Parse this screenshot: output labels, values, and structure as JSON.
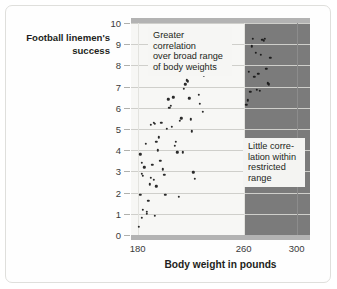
{
  "chart_data": {
    "type": "scatter",
    "title": "",
    "xlabel": "Body weight in pounds",
    "ylabel": "Football linemen's success",
    "xlim": [
      175,
      310
    ],
    "ylim": [
      0,
      10
    ],
    "xticks": [
      180,
      260,
      300
    ],
    "yticks": [
      0,
      1,
      2,
      3,
      4,
      5,
      6,
      7,
      8,
      9,
      10
    ],
    "grid": true,
    "legend": "none",
    "regions": [
      {
        "name": "broad-range-region",
        "x_start": 175,
        "x_end": 261,
        "shade": "#f7f7f5"
      },
      {
        "name": "restricted-range-region",
        "x_start": 261,
        "x_end": 310,
        "shade": "#7b7b7b"
      }
    ],
    "annotations": [
      {
        "name": "broad-range-note",
        "text": "Greater correlation\nover broad range\nof body weights"
      },
      {
        "name": "restricted-range-note",
        "text": "Little corre-\nlation within\nrestricted\nrange"
      }
    ],
    "points": [
      [
        181,
        0.4
      ],
      [
        182,
        1.9
      ],
      [
        183,
        0.8
      ],
      [
        184,
        1.2
      ],
      [
        183,
        2.9
      ],
      [
        182,
        3.8
      ],
      [
        183,
        3.4
      ],
      [
        184,
        2.8
      ],
      [
        185,
        3.2
      ],
      [
        186,
        4.3
      ],
      [
        187,
        1.0
      ],
      [
        187,
        1.1
      ],
      [
        188,
        1.6
      ],
      [
        189,
        2.4
      ],
      [
        190,
        2.7
      ],
      [
        191,
        3.3
      ],
      [
        192,
        2.6
      ],
      [
        193,
        0.9
      ],
      [
        194,
        2.3
      ],
      [
        195,
        4.0
      ],
      [
        194,
        4.4
      ],
      [
        196,
        4.6
      ],
      [
        197,
        3.5
      ],
      [
        198,
        5.3
      ],
      [
        190,
        5.2
      ],
      [
        192,
        5.3
      ],
      [
        193,
        5.25
      ],
      [
        199,
        3.1
      ],
      [
        200,
        2.85
      ],
      [
        201,
        1.9
      ],
      [
        202,
        5.0
      ],
      [
        203,
        6.4
      ],
      [
        204,
        6.0
      ],
      [
        205,
        6.1
      ],
      [
        206,
        5.1
      ],
      [
        207,
        6.5
      ],
      [
        208,
        4.2
      ],
      [
        209,
        4.4
      ],
      [
        210,
        3.9
      ],
      [
        211,
        1.8
      ],
      [
        212,
        5.4
      ],
      [
        213,
        5.5
      ],
      [
        214,
        3.9
      ],
      [
        215,
        6.9
      ],
      [
        216,
        7.1
      ],
      [
        217,
        7.3
      ],
      [
        218,
        7.25
      ],
      [
        219,
        6.45
      ],
      [
        220,
        5.45
      ],
      [
        221,
        4.9
      ],
      [
        222,
        2.95
      ],
      [
        223,
        2.65
      ],
      [
        224,
        7.6
      ],
      [
        225,
        7.8
      ],
      [
        226,
        6.6
      ],
      [
        227,
        6.2
      ],
      [
        228,
        8.1
      ],
      [
        229,
        5.8
      ],
      [
        230,
        7.5
      ],
      [
        262,
        6.15
      ],
      [
        263,
        6.35
      ],
      [
        264,
        7.7
      ],
      [
        265,
        6.75
      ],
      [
        266,
        8.9
      ],
      [
        267,
        9.25
      ],
      [
        268,
        7.45
      ],
      [
        269,
        8.6
      ],
      [
        270,
        6.85
      ],
      [
        271,
        7.6
      ],
      [
        272,
        6.8
      ],
      [
        273,
        8.5
      ],
      [
        274,
        9.2
      ],
      [
        275,
        9.15
      ],
      [
        276,
        9.25
      ],
      [
        277,
        7.85
      ],
      [
        278,
        7.15
      ],
      [
        279,
        7.1
      ],
      [
        280,
        8.35
      ]
    ]
  },
  "axis": {
    "x_tick_labels": [
      "180",
      "260",
      "300"
    ],
    "y_tick_labels": [
      "10",
      "9",
      "8",
      "7",
      "6",
      "5",
      "4",
      "3",
      "2",
      "1",
      "0"
    ],
    "x_axis_title": "Body weight in pounds",
    "y_axis_title": "Football linemen's\nsuccess"
  },
  "annotations": {
    "broad": "Greater correlation\nover broad range\nof body weights",
    "restricted": "Little corre-\nlation within\nrestricted\nrange"
  },
  "colors": {
    "dark_region": "#7b7b7b",
    "light_region": "#f7f7f5",
    "dot": "#2b2b2b",
    "gridline": "#cfcfcb",
    "band": "#b3b3b3",
    "text": "#231f20"
  }
}
